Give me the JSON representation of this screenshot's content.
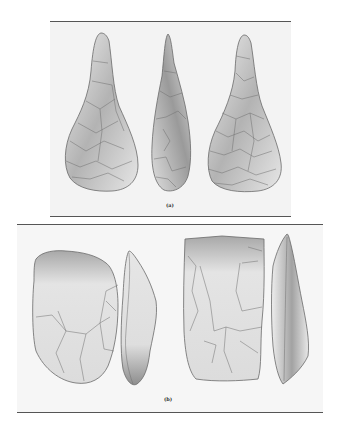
{
  "page": {
    "page_number": ""
  },
  "figure": {
    "panels": [
      {
        "id": "a",
        "caption": "(a)",
        "artifacts": [
          {
            "name": "hand-axe-front-view",
            "view": "face"
          },
          {
            "name": "hand-axe-side-view",
            "view": "profile"
          },
          {
            "name": "hand-axe-back-view",
            "view": "face"
          }
        ]
      },
      {
        "id": "b",
        "caption": "(b)",
        "artifacts": [
          {
            "name": "cleaver-1-face-view",
            "view": "face"
          },
          {
            "name": "cleaver-1-side-view",
            "view": "profile"
          },
          {
            "name": "cleaver-2-face-view",
            "view": "face"
          },
          {
            "name": "cleaver-2-side-view",
            "view": "profile"
          }
        ]
      }
    ],
    "colors": {
      "panel_bg": "#f3f3f3",
      "rule": "#555555",
      "stone_light": "#ececec",
      "stone_dark": "#8a8a8a"
    }
  }
}
